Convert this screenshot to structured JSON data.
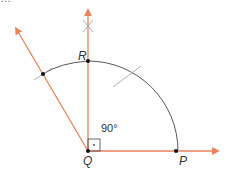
{
  "diagram": {
    "cut_text": "…",
    "colors": {
      "ray": "#e8825a",
      "arc": "#444444",
      "mark": "#9aa6ad",
      "point": "#111111"
    },
    "points": {
      "Q": {
        "label": "Q",
        "x": 88,
        "y": 151
      },
      "P": {
        "label": "P",
        "x": 176,
        "y": 151
      },
      "R": {
        "label": "R",
        "x": 88,
        "y": 61
      }
    },
    "angle_label": "90°"
  }
}
